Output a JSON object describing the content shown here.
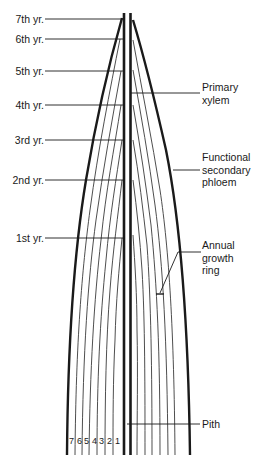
{
  "diagram": {
    "year_labels": [
      {
        "label": "7th yr.",
        "y": 19
      },
      {
        "label": "6th yr.",
        "y": 39
      },
      {
        "label": "5th yr.",
        "y": 71
      },
      {
        "label": "4th yr.",
        "y": 105
      },
      {
        "label": "3rd yr.",
        "y": 140
      },
      {
        "label": "2nd yr.",
        "y": 180
      },
      {
        "label": "1st yr.",
        "y": 238
      }
    ],
    "right_labels": [
      {
        "id": "primary-xylem",
        "lines": [
          "Primary",
          "xylem"
        ],
        "leader_y": 93
      },
      {
        "id": "functional-secondary-phloem",
        "lines": [
          "Functional",
          "secondary",
          "phloem"
        ],
        "leader_y": 170
      },
      {
        "id": "annual-growth-ring",
        "lines": [
          "Annual",
          "growth",
          "ring"
        ],
        "leader_y": 252
      },
      {
        "id": "pith",
        "lines": [
          "Pith"
        ],
        "leader_y": 424
      }
    ],
    "ring_numbers": [
      "7",
      "6",
      "5",
      "4",
      "3",
      "2",
      "1"
    ],
    "colors": {
      "line": "#1a1a1a",
      "thin_line": "#3a3a3a",
      "background": "#ffffff"
    }
  }
}
